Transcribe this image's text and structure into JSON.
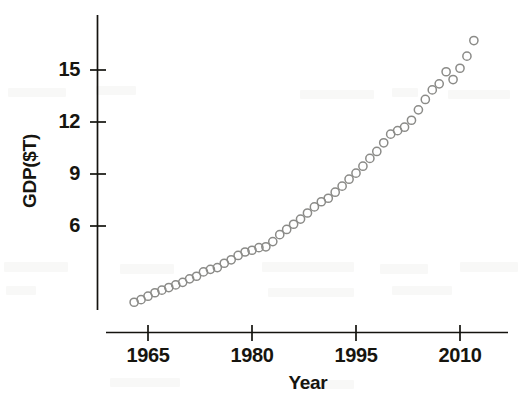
{
  "chart_data": {
    "type": "scatter",
    "title": "",
    "subtitle": "",
    "xlabel": "Year",
    "ylabel": "GDP($T)",
    "xlim": [
      1962,
      2013
    ],
    "ylim": [
      1.0,
      17.4
    ],
    "grid": false,
    "legend": null,
    "legend_position": "none",
    "marker": "open-circle",
    "marker_color": "#8b8b88",
    "axis_color": "#14130f",
    "xticks": [
      1965,
      1980,
      1995,
      2010
    ],
    "xtick_labels": [
      "1965",
      "1980",
      "1995",
      "2010"
    ],
    "yticks": [
      6,
      9,
      12,
      15
    ],
    "ytick_labels": [
      "6",
      "9",
      "12",
      "15"
    ],
    "x": [
      1963,
      1964,
      1965,
      1966,
      1967,
      1968,
      1969,
      1970,
      1971,
      1972,
      1973,
      1974,
      1975,
      1976,
      1977,
      1978,
      1979,
      1980,
      1981,
      1982,
      1983,
      1984,
      1985,
      1986,
      1987,
      1988,
      1989,
      1990,
      1991,
      1992,
      1993,
      1994,
      1995,
      1996,
      1997,
      1998,
      1999,
      2000,
      2001,
      2002,
      2003,
      2004,
      2005,
      2006,
      2007,
      2008,
      2009,
      2010,
      2011,
      2012
    ],
    "y": [
      1.6,
      1.75,
      1.95,
      2.15,
      2.3,
      2.45,
      2.6,
      2.75,
      2.95,
      3.1,
      3.35,
      3.5,
      3.6,
      3.85,
      4.05,
      4.3,
      4.5,
      4.6,
      4.75,
      4.8,
      5.1,
      5.5,
      5.8,
      6.1,
      6.4,
      6.75,
      7.1,
      7.4,
      7.6,
      7.95,
      8.3,
      8.7,
      9.05,
      9.45,
      9.9,
      10.3,
      10.8,
      11.3,
      11.5,
      11.7,
      12.1,
      12.7,
      13.3,
      13.85,
      14.2,
      14.9,
      14.45,
      15.1,
      15.8,
      16.7
    ],
    "x_pixel_per_year": 6.93,
    "series": [
      {
        "name": "GDP",
        "x": [
          1963,
          1964,
          1965,
          1966,
          1967,
          1968,
          1969,
          1970,
          1971,
          1972,
          1973,
          1974,
          1975,
          1976,
          1977,
          1978,
          1979,
          1980,
          1981,
          1982,
          1983,
          1984,
          1985,
          1986,
          1987,
          1988,
          1989,
          1990,
          1991,
          1992,
          1993,
          1994,
          1995,
          1996,
          1997,
          1998,
          1999,
          2000,
          2001,
          2002,
          2003,
          2004,
          2005,
          2006,
          2007,
          2008,
          2009,
          2010,
          2011,
          2012
        ],
        "values": [
          1.6,
          1.75,
          1.95,
          2.15,
          2.3,
          2.45,
          2.6,
          2.75,
          2.95,
          3.1,
          3.35,
          3.5,
          3.6,
          3.85,
          4.05,
          4.3,
          4.5,
          4.6,
          4.75,
          4.8,
          5.1,
          5.5,
          5.8,
          6.1,
          6.4,
          6.75,
          7.1,
          7.4,
          7.6,
          7.95,
          8.3,
          8.7,
          9.05,
          9.45,
          9.9,
          10.3,
          10.8,
          11.3,
          11.5,
          11.7,
          12.1,
          12.7,
          13.3,
          13.85,
          14.2,
          14.9,
          14.45,
          15.1,
          15.8,
          16.7
        ]
      }
    ],
    "annotations": []
  }
}
